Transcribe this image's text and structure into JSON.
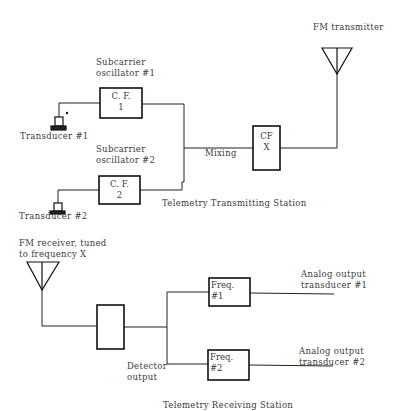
{
  "transmitting_station": {
    "title": "Telemetry Transmitting Station",
    "subcarrier_1": {
      "label_line1": "Subcarrier",
      "label_line2": "oscillator #1",
      "box_line1": "C. F.",
      "box_line2": "1"
    },
    "subcarrier_2": {
      "label_line1": "Subcarrier",
      "label_line2": "oscillator #2",
      "box_line1": "C. F.",
      "box_line2": "2"
    },
    "transducer_1": "Transducer #1",
    "transducer_2": "Transducer #2",
    "mixing": "Mixing",
    "mixer_box": {
      "line1": "CF",
      "line2": "X"
    },
    "fm_transmitter": "FM transmitter"
  },
  "receiving_station": {
    "title": "Telemetry Receiving Station",
    "fm_receiver": {
      "line1": "FM receiver, tuned",
      "line2": "to frequency X"
    },
    "detector_output": {
      "line1": "Detector",
      "line2": "output"
    },
    "freq_1": {
      "line1": "Freq.",
      "line2": "#1"
    },
    "freq_2": {
      "line1": "Freq.",
      "line2": "#2"
    },
    "analog_output_1": {
      "line1": "Analog output",
      "line2": "transducer #1"
    },
    "analog_output_2": {
      "line1": "Analog output",
      "line2": "transducer #2"
    }
  }
}
